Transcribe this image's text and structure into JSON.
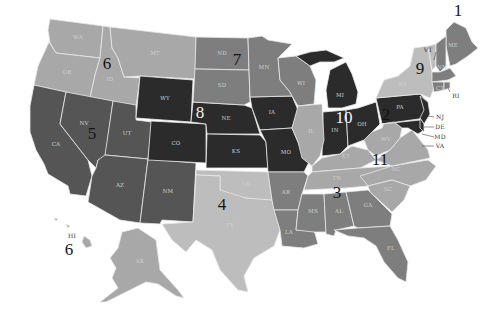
{
  "map": {
    "title": "",
    "shade_colors": {
      "darkest": "#2b2b2b",
      "dark": "#555555",
      "medium_dark": "#666666",
      "medium": "#7e7e7e",
      "light": "#a8a8a8",
      "lightest": "#bdbdbd"
    },
    "regions": [
      {
        "id": 1,
        "label": "1",
        "states": [
          "ME",
          "NH",
          "MA",
          "CT",
          "RI"
        ],
        "shade": "medium"
      },
      {
        "id": 2,
        "label": "2",
        "states": [
          "PA",
          "NJ",
          "DE",
          "MD"
        ],
        "shade": "darkest"
      },
      {
        "id": 3,
        "label": "3",
        "states": [
          "AR",
          "LA",
          "MS",
          "AL",
          "GA",
          "FL"
        ],
        "shade": "medium"
      },
      {
        "id": 4,
        "label": "4",
        "states": [
          "TX",
          "OK"
        ],
        "shade": "lightest"
      },
      {
        "id": 5,
        "label": "5",
        "states": [
          "CA",
          "NV",
          "UT",
          "AZ",
          "NM"
        ],
        "shade": "dark"
      },
      {
        "id": 6,
        "label": "6",
        "states": [
          "WA",
          "OR",
          "ID",
          "MT",
          "AK",
          "HI"
        ],
        "shade": "light"
      },
      {
        "id": 7,
        "label": "7",
        "states": [
          "ND",
          "SD",
          "MN",
          "WI"
        ],
        "shade": "medium"
      },
      {
        "id": 8,
        "label": "8",
        "states": [
          "WY",
          "CO",
          "NE",
          "KS",
          "IA",
          "MO"
        ],
        "shade": "darkest"
      },
      {
        "id": 9,
        "label": "9",
        "states": [
          "NY",
          "VT"
        ],
        "shade": "lightest"
      },
      {
        "id": 10,
        "label": "10",
        "states": [
          "MI",
          "IN",
          "OH"
        ],
        "shade": "darkest"
      },
      {
        "id": 11,
        "label": "11",
        "states": [
          "WV",
          "VA",
          "KY",
          "TN",
          "NC",
          "SC"
        ],
        "shade": "light"
      }
    ],
    "state_labels": {
      "WA": "WA",
      "OR": "OR",
      "ID": "ID",
      "MT": "MT",
      "WY": "WY",
      "ND": "ND",
      "SD": "SD",
      "NE": "NE",
      "KS": "KS",
      "CO": "CO",
      "UT": "UT",
      "NV": "NV",
      "CA": "CA",
      "AZ": "AZ",
      "NM": "NM",
      "OK": "OK",
      "TX": "TX",
      "MN": "MN",
      "IA": "IA",
      "MO": "MO",
      "AR": "AR",
      "LA": "LA",
      "WI": "WI",
      "IL": "IL",
      "MI": "MI",
      "IN": "IN",
      "OH": "OH",
      "KY": "KY",
      "TN": "TN",
      "MS": "MS",
      "AL": "AL",
      "GA": "GA",
      "FL": "FL",
      "SC": "SC",
      "NC": "NC",
      "VA": "VA",
      "WV": "WV",
      "PA": "PA",
      "NY": "NY",
      "VT": "VT",
      "NH": "NH",
      "ME": "ME",
      "MA": "MA",
      "CT": "CT",
      "RI": "RI",
      "NJ": "NJ",
      "DE": "DE",
      "MD": "MD",
      "AK": "AK",
      "HI": "HI"
    },
    "region_numbers": {
      "r1": "1",
      "r2": "2",
      "r3": "3",
      "r4": "4",
      "r5": "5",
      "r6": "6",
      "r6b": "6",
      "r7": "7",
      "r8": "8",
      "r9": "9",
      "r10": "10",
      "r11": "11"
    }
  }
}
